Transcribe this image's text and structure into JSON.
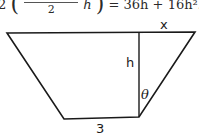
{
  "equation": {
    "prefix": "2",
    "fraction_denominator": "2",
    "after_fraction": "h",
    "rhs": "= 36h + 16h²."
  },
  "diagram": {
    "shape": "trapezoid",
    "stroke_color": "#1a1a1a",
    "vertices": {
      "top_left": [
        7,
        33
      ],
      "top_right": [
        195,
        32
      ],
      "bottom_right": [
        139,
        117
      ],
      "bottom_left": [
        64,
        119
      ]
    },
    "height_line": {
      "x": 139,
      "y_top": 32,
      "y_bottom": 117
    },
    "labels": {
      "top_segment": "x",
      "height": "h",
      "angle": "θ",
      "bottom_base": "3"
    }
  }
}
